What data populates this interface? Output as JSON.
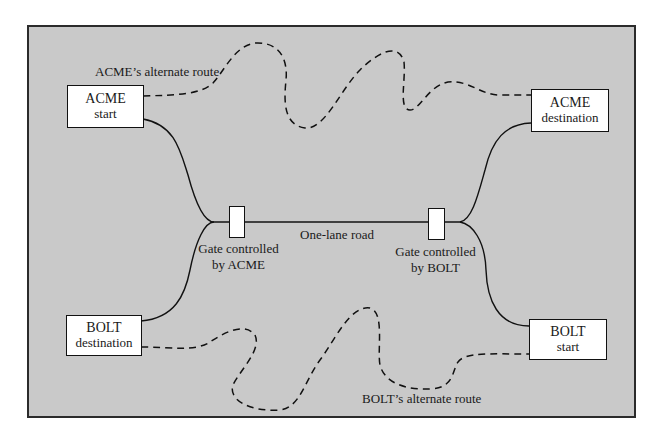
{
  "diagram": {
    "title": "",
    "colors": {
      "panel_background": "#c9c9c9",
      "panel_border": "#2b2b2b",
      "box_fill": "#ffffff",
      "line": "#111111"
    },
    "nodes": {
      "acme_start": {
        "name": "ACME",
        "role": "start"
      },
      "acme_destination": {
        "name": "ACME",
        "role": "destination"
      },
      "bolt_destination": {
        "name": "BOLT",
        "role": "destination"
      },
      "bolt_start": {
        "name": "BOLT",
        "role": "start"
      }
    },
    "gates": {
      "acme_gate": {
        "line1": "Gate controlled",
        "line2": "by ACME"
      },
      "bolt_gate": {
        "line1": "Gate controlled",
        "line2": "by BOLT"
      }
    },
    "road": {
      "label": "One-lane road"
    },
    "routes": {
      "acme_alternate": {
        "label": "ACME’s alternate route",
        "style": "dashed"
      },
      "bolt_alternate": {
        "label": "BOLT’s alternate route",
        "style": "dashed"
      }
    },
    "edges": [
      {
        "from": "ACME start",
        "to": "Gate controlled by ACME",
        "style": "solid"
      },
      {
        "from": "BOLT destination",
        "to": "Gate controlled by ACME",
        "style": "solid"
      },
      {
        "from": "Gate controlled by ACME",
        "to": "Gate controlled by BOLT",
        "style": "solid",
        "label": "One-lane road"
      },
      {
        "from": "Gate controlled by BOLT",
        "to": "ACME destination",
        "style": "solid"
      },
      {
        "from": "Gate controlled by BOLT",
        "to": "BOLT start",
        "style": "solid"
      },
      {
        "from": "ACME start",
        "to": "ACME destination",
        "style": "dashed",
        "label": "ACME’s alternate route"
      },
      {
        "from": "BOLT start",
        "to": "BOLT destination",
        "style": "dashed",
        "label": "BOLT’s alternate route"
      }
    ]
  }
}
